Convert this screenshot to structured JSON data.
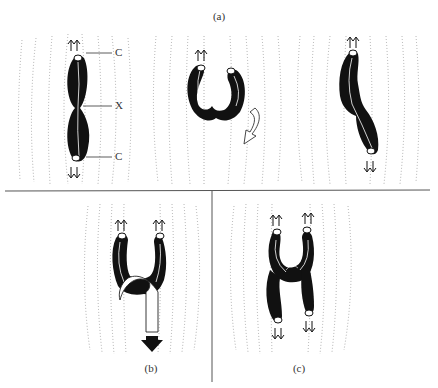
{
  "figure": {
    "panel_a": {
      "caption": "(a)",
      "sub_panels": [
        {
          "id": "a1",
          "description": "bivalent aligned along spindle axis, centromeres at poles",
          "labels": [
            "C",
            "X",
            "C"
          ]
        },
        {
          "id": "a2",
          "description": "U-shaped bivalent with both centromeres oriented to the same pole, rotation arrow"
        },
        {
          "id": "a3",
          "description": "S-shaped bivalent, centromeres oriented to opposite poles"
        }
      ]
    },
    "panel_b": {
      "caption": "(b)",
      "description": "U-shaped chromosome with a second chromosome loop pulled downward by an arrow"
    },
    "panel_c": {
      "caption": "(c)",
      "description": "Two interlocked U-shaped chromosomes with centromeres pointing to opposite poles"
    },
    "labels": {
      "centromere_top": "C",
      "chiasma": "X",
      "centromere_bottom": "C"
    },
    "pole_arrows": {
      "up": "⇈",
      "down": "⇊"
    },
    "colors": {
      "chromosome": "#111111",
      "spindle_fibres": "#9a9a9a",
      "divider": "#555555",
      "background": "#ffffff"
    }
  }
}
